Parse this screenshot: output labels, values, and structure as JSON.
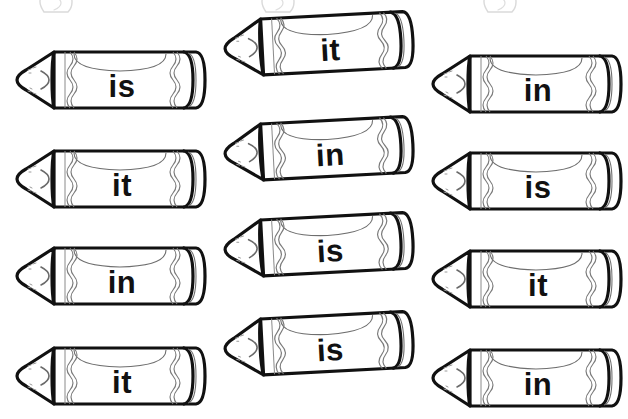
{
  "page": {
    "background_color": "#ffffff",
    "ink_color": "#111111",
    "width": 628,
    "height": 419
  },
  "worksheet": {
    "shape_name": "crayon",
    "columns": 3,
    "rows": 4,
    "words_used": [
      "is",
      "it",
      "in"
    ],
    "grid": [
      [
        "is",
        "it",
        "in"
      ],
      [
        "it",
        "in",
        "is"
      ],
      [
        "in",
        "is",
        "it"
      ],
      [
        "it",
        "is",
        "in"
      ]
    ]
  },
  "crayons": [
    {
      "id": "crayon-r1c1",
      "word": "is",
      "column": "left",
      "row": 1,
      "x": 8,
      "y": 44,
      "rotate": 0
    },
    {
      "id": "crayon-r1c2",
      "word": "it",
      "column": "middle",
      "row": 1,
      "x": 216,
      "y": 8,
      "rotate": -3
    },
    {
      "id": "crayon-r1c3",
      "word": "in",
      "column": "right",
      "row": 1,
      "x": 424,
      "y": 48,
      "rotate": 0
    },
    {
      "id": "crayon-r2c1",
      "word": "it",
      "column": "left",
      "row": 2,
      "x": 8,
      "y": 143,
      "rotate": 0
    },
    {
      "id": "crayon-r2c2",
      "word": "in",
      "column": "middle",
      "row": 2,
      "x": 216,
      "y": 113,
      "rotate": -3
    },
    {
      "id": "crayon-r2c3",
      "word": "is",
      "column": "right",
      "row": 2,
      "x": 424,
      "y": 145,
      "rotate": 0
    },
    {
      "id": "crayon-r3c1",
      "word": "in",
      "column": "left",
      "row": 3,
      "x": 8,
      "y": 240,
      "rotate": 0
    },
    {
      "id": "crayon-r3c2",
      "word": "is",
      "column": "middle",
      "row": 3,
      "x": 216,
      "y": 209,
      "rotate": -3
    },
    {
      "id": "crayon-r3c3",
      "word": "it",
      "column": "right",
      "row": 3,
      "x": 424,
      "y": 243,
      "rotate": 0
    },
    {
      "id": "crayon-r4c1",
      "word": "it",
      "column": "left",
      "row": 4,
      "x": 8,
      "y": 340,
      "rotate": 0
    },
    {
      "id": "crayon-r4c2",
      "word": "is",
      "column": "middle",
      "row": 4,
      "x": 216,
      "y": 308,
      "rotate": -3
    },
    {
      "id": "crayon-r4c3",
      "word": "in",
      "column": "right",
      "row": 4,
      "x": 424,
      "y": 342,
      "rotate": 0
    }
  ],
  "page_edge_fragments": [
    {
      "id": "fragment-top-left",
      "x": 34,
      "y": -12
    },
    {
      "id": "fragment-top-center",
      "x": 256,
      "y": -12
    },
    {
      "id": "fragment-top-right",
      "x": 478,
      "y": -12
    }
  ]
}
